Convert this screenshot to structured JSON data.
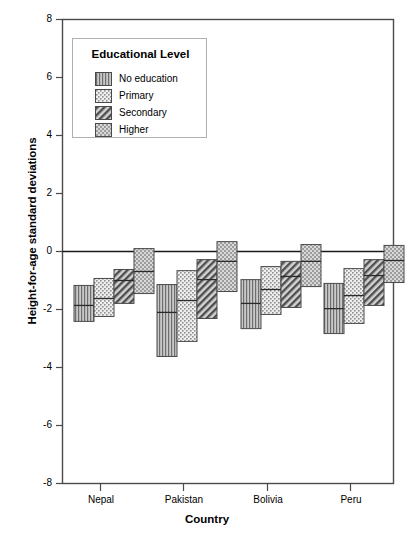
{
  "chart_data": {
    "type": "bar",
    "subtype": "box-plot-style stacked range bars",
    "title": "",
    "xlabel": "Country",
    "ylabel": "Height-for-age standard deviations",
    "ylim": [
      -8,
      8
    ],
    "yticks": [
      8,
      6,
      4,
      2,
      0,
      -2,
      -4,
      -6,
      -8
    ],
    "ytick_labels": [
      "8",
      "6",
      "4",
      "2",
      "0",
      "-2",
      "-4",
      "-6",
      "-8"
    ],
    "grid": false,
    "zero_line": true,
    "categories": [
      "Nepal",
      "Pakistan",
      "Bolivia",
      "Peru"
    ],
    "legend": {
      "title": "Educational Level",
      "position": "upper-left-inside",
      "entries": [
        {
          "name": "No education",
          "pattern": "vertical-lines"
        },
        {
          "name": "Primary",
          "pattern": "light-dots"
        },
        {
          "name": "Secondary",
          "pattern": "diagonal-hatch"
        },
        {
          "name": "Higher",
          "pattern": "dense-dots"
        }
      ]
    },
    "series": [
      {
        "name": "No education",
        "pattern": "vertical-lines",
        "boxes": [
          {
            "category": "Nepal",
            "top": -1.17,
            "median": -1.86,
            "bottom": -2.41
          },
          {
            "category": "Pakistan",
            "top": -1.14,
            "median": -2.1,
            "bottom": -3.62
          },
          {
            "category": "Bolivia",
            "top": -0.97,
            "median": -1.79,
            "bottom": -2.66
          },
          {
            "category": "Peru",
            "top": -1.1,
            "median": -1.97,
            "bottom": -2.83
          }
        ]
      },
      {
        "name": "Primary",
        "pattern": "light-dots",
        "boxes": [
          {
            "category": "Nepal",
            "top": -0.93,
            "median": -1.62,
            "bottom": -2.24
          },
          {
            "category": "Pakistan",
            "top": -0.66,
            "median": -1.69,
            "bottom": -3.1
          },
          {
            "category": "Bolivia",
            "top": -0.52,
            "median": -1.31,
            "bottom": -2.17
          },
          {
            "category": "Peru",
            "top": -0.59,
            "median": -1.52,
            "bottom": -2.48
          }
        ]
      },
      {
        "name": "Secondary",
        "pattern": "diagonal-hatch",
        "boxes": [
          {
            "category": "Nepal",
            "top": -0.62,
            "median": -1.0,
            "bottom": -1.79
          },
          {
            "category": "Pakistan",
            "top": -0.28,
            "median": -0.97,
            "bottom": -2.31
          },
          {
            "category": "Bolivia",
            "top": -0.34,
            "median": -0.86,
            "bottom": -1.93
          },
          {
            "category": "Peru",
            "top": -0.28,
            "median": -0.83,
            "bottom": -1.86
          }
        ]
      },
      {
        "name": "Higher",
        "pattern": "dense-dots",
        "boxes": [
          {
            "category": "Nepal",
            "top": 0.1,
            "median": -0.69,
            "bottom": -1.45
          },
          {
            "category": "Pakistan",
            "top": 0.34,
            "median": -0.34,
            "bottom": -1.38
          },
          {
            "category": "Bolivia",
            "top": 0.24,
            "median": -0.34,
            "bottom": -1.21
          },
          {
            "category": "Peru",
            "top": 0.21,
            "median": -0.31,
            "bottom": -1.07
          }
        ]
      }
    ]
  },
  "axis": {
    "ytick_labels": [
      "8",
      "6",
      "4",
      "2",
      "0",
      "-2",
      "-4",
      "-6",
      "-8"
    ],
    "xtick_labels": [
      "Nepal",
      "Pakistan",
      "Bolivia",
      "Peru"
    ],
    "ylabel": "Height-for-age standard deviations",
    "xlabel": "Country"
  },
  "legend": {
    "title": "Educational Level",
    "items": [
      {
        "label": "No education"
      },
      {
        "label": "Primary"
      },
      {
        "label": "Secondary"
      },
      {
        "label": "Higher"
      }
    ]
  },
  "colors": {
    "frame": "#4a4a4a",
    "zero_line": "#1a1a1a",
    "box_edge": "#4a4a4a",
    "fill_light": "#e8e8e8",
    "fill_mid": "#b8b8b8",
    "fill_dark": "#9a9a9a",
    "background": "#ffffff"
  }
}
